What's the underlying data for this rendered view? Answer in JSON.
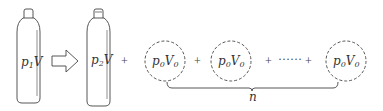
{
  "diagram": {
    "cylinder_initial": {
      "label_base": "p",
      "label_sub": "1",
      "label_tail": "V"
    },
    "arrow": {
      "direction": "right"
    },
    "cylinder_final": {
      "label_base": "p",
      "label_sub": "2",
      "label_tail": "V"
    },
    "plus_sign": "+",
    "ellipsis": "······",
    "bubbles": [
      {
        "label_base": "p",
        "label_sub0": "0",
        "label_mid": "V",
        "label_sub1": "0"
      },
      {
        "label_base": "p",
        "label_sub0": "0",
        "label_mid": "V",
        "label_sub1": "0"
      },
      {
        "label_base": "p",
        "label_sub0": "0",
        "label_mid": "V",
        "label_sub1": "0"
      }
    ],
    "brace_label": "n",
    "colors": {
      "stroke": "#444444",
      "background": "#ffffff"
    }
  }
}
